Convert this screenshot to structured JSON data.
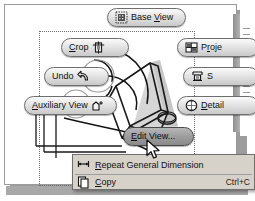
{
  "app": {
    "context": "cad-view-context-menu",
    "accent_dark": "#8a8a8a",
    "panel_bg": "#ffffff",
    "menu_bg": "#d6d2ca",
    "border": "#6e6e6e"
  },
  "marking_menu": {
    "buttons": [
      {
        "id": "base-view",
        "label_pre": "Base ",
        "label_key": "V",
        "label_post": "iew",
        "icon": "base-view-icon",
        "state": "normal",
        "clipped": false
      },
      {
        "id": "crop",
        "label_pre": "",
        "label_key": "C",
        "label_post": "rop",
        "icon": "crop-icon",
        "state": "normal",
        "clipped": false
      },
      {
        "id": "undo",
        "label_pre": "Undo",
        "label_key": "",
        "label_post": "",
        "icon": "undo-arrow-icon",
        "state": "normal",
        "clipped": false
      },
      {
        "id": "auxiliary-view",
        "label_pre": "",
        "label_key": "A",
        "label_post": "uxiliary View",
        "icon": "auxiliary-view-icon",
        "state": "normal",
        "clipped": false
      },
      {
        "id": "edit-view",
        "label_pre": "",
        "label_key": "E",
        "label_post": "dit View...",
        "icon": "",
        "state": "highlighted",
        "clipped": false
      },
      {
        "id": "projected",
        "label_pre": "P",
        "label_key": "r",
        "label_post": "oje",
        "icon": "projected-view-icon",
        "state": "normal",
        "clipped": true
      },
      {
        "id": "section",
        "label_pre": "S",
        "label_key": "",
        "label_post": "",
        "icon": "section-view-icon",
        "state": "normal",
        "clipped": true
      },
      {
        "id": "detail",
        "label_pre": "",
        "label_key": "D",
        "label_post": "etail",
        "icon": "detail-view-icon",
        "state": "normal",
        "clipped": true
      }
    ]
  },
  "context_menu": {
    "items": [
      {
        "id": "repeat-general-dimension",
        "label_pre": "",
        "label_key": "R",
        "label_post": "epeat General Dimension",
        "shortcut": "",
        "icon": "dimension-icon"
      },
      {
        "id": "copy",
        "label_pre": "",
        "label_key": "C",
        "label_post": "opy",
        "shortcut": "Ctrl+C",
        "icon": "copy-icon"
      }
    ]
  },
  "canvas": {
    "selection_label": "dotted-selection-rectangle",
    "model_label": "3d-part-model"
  }
}
